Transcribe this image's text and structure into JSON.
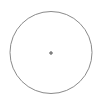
{
  "diagram": {
    "shape": "circle",
    "center": {
      "x": 51,
      "y": 52.5
    },
    "radius": 41,
    "stroke_color": "#8a8a8a",
    "fill_color": "#ffffff",
    "center_marker": {
      "type": "crosshair",
      "size": 4,
      "color": "#555555"
    }
  }
}
